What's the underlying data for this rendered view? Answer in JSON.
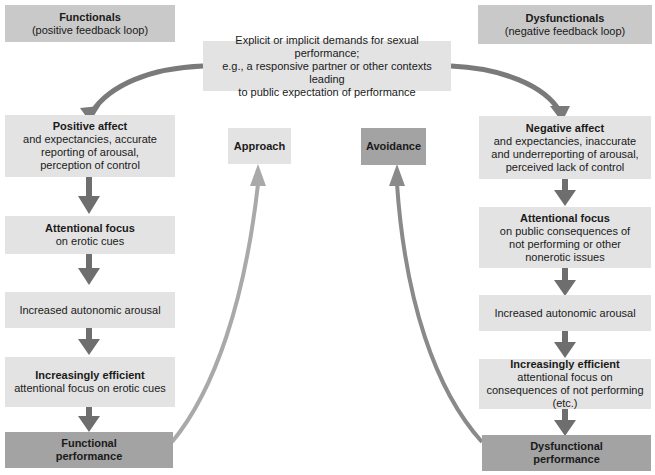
{
  "left_header": {
    "title": "Functionals",
    "subtitle": "(positive feedback loop)"
  },
  "right_header": {
    "title": "Dysfunctionals",
    "subtitle": "(negative feedback loop)"
  },
  "center_top": {
    "line1": "Explicit or implicit demands for sexual performance;",
    "line2": "e.g., a responsive partner or other contexts leading",
    "line3": "to public expectation of performance"
  },
  "approach": {
    "label": "Approach"
  },
  "avoidance": {
    "label": "Avoidance"
  },
  "left_chain": [
    {
      "title": "Positive affect",
      "body": "and expectancies, accurate reporting of arousal, perception of control"
    },
    {
      "title": "Attentional focus",
      "body": "on erotic cues"
    },
    {
      "title": "",
      "body": "Increased autonomic arousal"
    },
    {
      "title": "Increasingly efficient",
      "body": "attentional focus on erotic cues"
    },
    {
      "title": "Functional performance",
      "body": ""
    }
  ],
  "right_chain": [
    {
      "title": "Negative affect",
      "body": "and expectancies, inaccurate and underreporting of arousal, perceived lack of control"
    },
    {
      "title": "Attentional focus",
      "body": "on public consequences of not performing or other nonerotic issues"
    },
    {
      "title": "",
      "body": "Increased autonomic arousal"
    },
    {
      "title": "Increasingly efficient",
      "body": "attentional focus on consequences of not performing (etc.)"
    },
    {
      "title": "Dysfunctional performance",
      "body": ""
    }
  ],
  "colors": {
    "light": "#e3e3e3",
    "mid": "#c9c9c9",
    "dark": "#a3a3a3",
    "arrow": "#7a7a7a",
    "approach_arrow": "#a9a9a9"
  }
}
